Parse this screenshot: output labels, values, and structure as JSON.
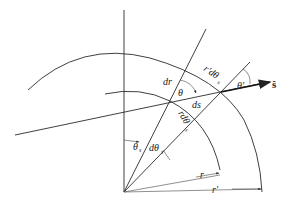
{
  "diagram": {
    "type": "geometry",
    "labels": {
      "dr": "dr",
      "theta": "θ",
      "ds": "ds",
      "r_dtheta_outer": "r′dθ",
      "r_dtheta_outer_sub": "s",
      "r_dtheta_inner": "rdθ",
      "r_dtheta_inner_sub": "s",
      "theta_prime": "θ′",
      "s_hat": "ŝ",
      "theta_s": "θ",
      "theta_s_sub": "s",
      "dtheta_s": "dθ",
      "dtheta_s_sub": "s",
      "r": "r",
      "r_prime": "r′"
    },
    "colors": {
      "line": "#2a2a2a",
      "background": "#ffffff"
    }
  }
}
